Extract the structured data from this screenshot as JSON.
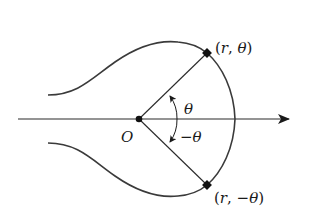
{
  "diagram": {
    "colors": {
      "stroke": "#3a3a3a",
      "text": "#1a1a1a",
      "background": "#ffffff"
    },
    "origin": {
      "label": "O",
      "x": 139,
      "y": 119
    },
    "polar_axis": {
      "from_x": 18,
      "to_x": 290,
      "y": 119,
      "arrow": "right"
    },
    "points": [
      {
        "id": "upper",
        "label_open": "(",
        "label_r": "r",
        "label_sep": ", ",
        "label_angle": "θ",
        "label_close": ")",
        "x": 207,
        "y": 53
      },
      {
        "id": "lower",
        "label_open": "(",
        "label_r": "r",
        "label_sep": ", ",
        "label_angle": "−θ",
        "label_close": ")",
        "x": 207,
        "y": 185
      }
    ],
    "angles": [
      {
        "label": "θ",
        "direction": "counterclockwise"
      },
      {
        "label": "−θ",
        "direction": "clockwise"
      }
    ]
  }
}
